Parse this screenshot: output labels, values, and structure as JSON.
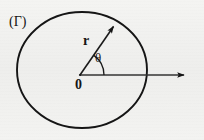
{
  "figure": {
    "type": "polar-coordinate-diagram",
    "background_color": "#f2f2f0",
    "ink_color": "#151515",
    "labels": {
      "curve_name": "(Γ)",
      "radius": "r",
      "angle": "θ",
      "origin": "0"
    },
    "geometry": {
      "closed_curve": {
        "shape": "ellipse",
        "center_x": 82,
        "center_y": 70,
        "radius_x": 65,
        "radius_y": 58,
        "stroke_width": 1.8
      },
      "origin_point": {
        "x": 80,
        "y": 75
      },
      "polar_axis": {
        "from_x": 80,
        "from_y": 75,
        "to_x": 188,
        "to_y": 75,
        "arrowhead": "filled-triangle"
      },
      "radius_vector": {
        "from_x": 80,
        "from_y": 75,
        "to_x": 116,
        "to_y": 23,
        "arrowhead": "filled-triangle",
        "angle_degrees": 55
      },
      "angle_arc": {
        "center_x": 80,
        "center_y": 75,
        "radius": 24,
        "start_degrees": 0,
        "end_degrees": 55
      }
    }
  }
}
